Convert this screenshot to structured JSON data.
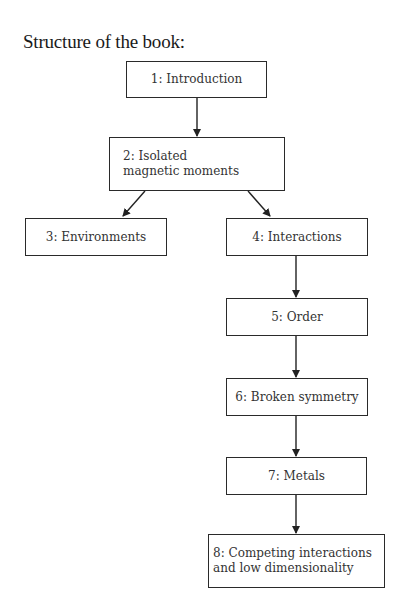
{
  "title": "Structure of the book:",
  "nodes": [
    {
      "id": "1",
      "label": "1: Introduction"
    },
    {
      "id": "2",
      "label": "2: Isolated\nmagnetic moments"
    },
    {
      "id": "3",
      "label": "3: Environments"
    },
    {
      "id": "4",
      "label": "4: Interactions"
    },
    {
      "id": "5",
      "label": "5: Order"
    },
    {
      "id": "6",
      "label": "6: Broken symmetry"
    },
    {
      "id": "7",
      "label": "7: Metals"
    },
    {
      "id": "8",
      "label": "8: Competing interactions\nand low dimensionality"
    }
  ],
  "edges": [
    [
      "1",
      "2"
    ],
    [
      "2",
      "3"
    ],
    [
      "2",
      "4"
    ],
    [
      "4",
      "5"
    ],
    [
      "5",
      "6"
    ],
    [
      "6",
      "7"
    ],
    [
      "7",
      "8"
    ]
  ]
}
